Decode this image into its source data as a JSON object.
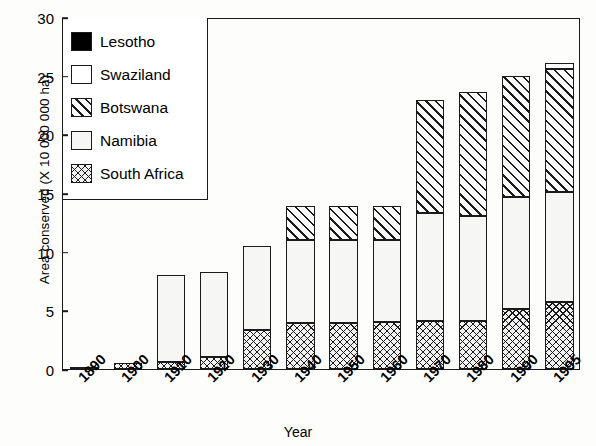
{
  "chart_data": {
    "type": "bar",
    "subtype": "stacked-bar",
    "title": "",
    "xlabel": "Year",
    "ylabel": "Area conserved (X 10 000 000 ha)",
    "ylim": [
      0,
      30
    ],
    "yticks": [
      0,
      5,
      10,
      15,
      20,
      25,
      30
    ],
    "ytick_labels": [
      "0",
      "5",
      "10",
      "15",
      "20",
      "25",
      "30"
    ],
    "grid": false,
    "legend_position": "top-left",
    "categories": [
      "1890",
      "1900",
      "1910",
      "1920",
      "1930",
      "1940",
      "1950",
      "1960",
      "1970",
      "1980",
      "1990",
      "1995"
    ],
    "series": [
      {
        "name": "South Africa",
        "pattern": "crosshatch",
        "values": [
          0.1,
          0.5,
          0.6,
          1.0,
          3.3,
          3.9,
          3.9,
          4.0,
          4.1,
          4.1,
          5.1,
          5.7
        ]
      },
      {
        "name": "Namibia",
        "pattern": "dotted",
        "values": [
          0.0,
          0.0,
          7.4,
          7.3,
          7.2,
          7.1,
          7.1,
          7.0,
          9.2,
          8.9,
          9.6,
          9.4
        ]
      },
      {
        "name": "Botswana",
        "pattern": "diagonal-hatch",
        "values": [
          0.0,
          0.0,
          0.0,
          0.0,
          0.0,
          2.9,
          2.9,
          2.9,
          9.6,
          10.6,
          10.3,
          10.5
        ]
      },
      {
        "name": "Swaziland",
        "pattern": "white",
        "values": [
          0.0,
          0.0,
          0.0,
          0.0,
          0.0,
          0.0,
          0.0,
          0.0,
          0.0,
          0.0,
          0.0,
          0.5
        ]
      },
      {
        "name": "Lesotho",
        "pattern": "solid-black",
        "values": [
          0.0,
          0.0,
          0.0,
          0.0,
          0.0,
          0.0,
          0.0,
          0.0,
          0.0,
          0.0,
          0.0,
          0.0
        ]
      }
    ],
    "totals": [
      0.1,
      0.5,
      8.0,
      8.3,
      10.5,
      13.9,
      13.9,
      13.9,
      22.9,
      23.6,
      25.0,
      26.1
    ]
  },
  "legend": {
    "entries": [
      {
        "label": "Lesotho",
        "key": "lesotho"
      },
      {
        "label": "Swaziland",
        "key": "swaziland"
      },
      {
        "label": "Botswana",
        "key": "botswana"
      },
      {
        "label": "Namibia",
        "key": "namibia"
      },
      {
        "label": "South Africa",
        "key": "southafrica"
      }
    ]
  },
  "colors": {
    "axis": "#1a1a1a",
    "background": "#fdfdfb",
    "lesotho": "#000000",
    "swaziland": "#ffffff",
    "botswana": "#fafafa",
    "namibia": "#f6f6f4",
    "southafrica": "#f2f2f2"
  }
}
